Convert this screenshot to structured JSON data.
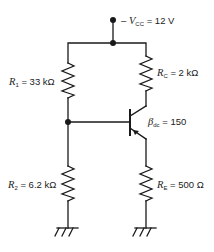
{
  "diagram": {
    "type": "circuit-schematic",
    "supply": {
      "symbol": "V",
      "subscript": "CC",
      "prefix": "–",
      "value": "= 12 V"
    },
    "components": [
      {
        "id": "R1",
        "symbol": "R",
        "subscript": "1",
        "value": "= 33 kΩ",
        "position": "left-upper"
      },
      {
        "id": "R2",
        "symbol": "R",
        "subscript": "2",
        "value": "= 6.2 kΩ",
        "position": "left-lower"
      },
      {
        "id": "RC",
        "symbol": "R",
        "subscript": "C",
        "value": "= 2 kΩ",
        "position": "right-upper"
      },
      {
        "id": "RE",
        "symbol": "R",
        "subscript": "E",
        "value": "= 500 Ω",
        "position": "right-lower"
      },
      {
        "id": "Q1",
        "symbol": "β",
        "subscript": "dc",
        "value": "= 150",
        "position": "transistor"
      }
    ],
    "grounds": 2,
    "colors": {
      "line": "#1a1a1a",
      "text": "#222222",
      "background": "#ffffff"
    }
  }
}
